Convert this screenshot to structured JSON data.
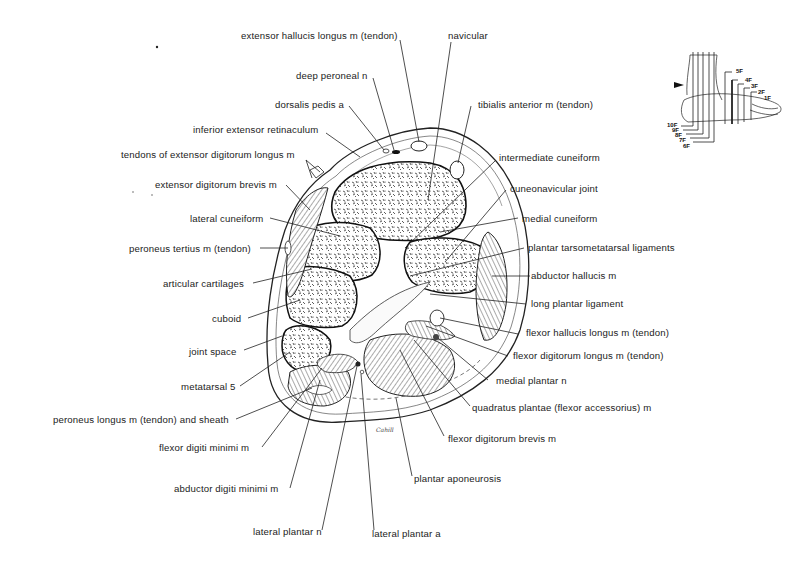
{
  "figure": {
    "signature": "Cahill",
    "labels": {
      "extensor_hallucis_longus": "extensor hallucis longus m (tendon)",
      "navicular": "navicular",
      "deep_peroneal_n": "deep peroneal n",
      "dorsalis_pedis_a": "dorsalis pedis a",
      "tibialis_anterior": "tibialis anterior m (tendon)",
      "inferior_extensor_retinaculum": "inferior extensor retinaculum",
      "tendons_extensor_digitorum_longus": "tendons of extensor digitorum longus m",
      "intermediate_cuneiform": "intermediate cuneiform",
      "extensor_digitorum_brevis": "extensor digitorum brevis m",
      "cuneonavicular_joint": "cuneonavicular joint",
      "lateral_cuneiform": "lateral cuneiform",
      "medial_cuneiform": "medial cuneiform",
      "peroneus_tertius": "peroneus tertius m (tendon)",
      "plantar_tarsometatarsal_ligaments": "plantar tarsometatarsal ligaments",
      "articular_cartilages": "articular cartilages",
      "abductor_hallucis": "abductor hallucis m",
      "cuboid": "cuboid",
      "long_plantar_ligament": "long plantar ligament",
      "flexor_hallucis_longus": "flexor hallucis longus m (tendon)",
      "joint_space": "joint space",
      "flexor_digitorum_longus": "flexor digitorum longus m (tendon)",
      "metatarsal_5": "metatarsal 5",
      "medial_plantar_n": "medial plantar n",
      "peroneus_longus": "peroneus longus m (tendon) and sheath",
      "quadratus_plantae": "quadratus plantae (flexor accessorius) m",
      "flexor_digiti_minimi": "flexor digiti minimi m",
      "flexor_digitorum_brevis": "flexor digitorum brevis m",
      "plantar_aponeurosis": "plantar aponeurosis",
      "abductor_digiti_minimi": "abductor digiti minimi m",
      "lateral_plantar_n": "lateral plantar n",
      "lateral_plantar_a": "lateral plantar a"
    },
    "inset": {
      "description": "orientation diagram of foot with section planes",
      "marker": "arrowhead",
      "levels_right": [
        "5F",
        "4F",
        "3F",
        "2F",
        "1F"
      ],
      "levels_left": [
        "10F",
        "9F",
        "8F",
        "7F",
        "6F"
      ],
      "highlighted_level": "4F"
    }
  }
}
